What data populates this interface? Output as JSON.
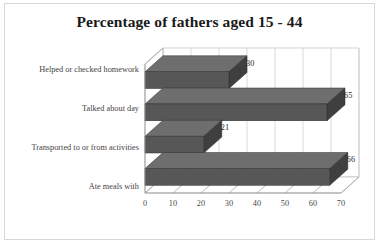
{
  "chart_data": {
    "type": "bar",
    "orientation": "horizontal",
    "title": "Percentage of fathers aged 15 - 44",
    "xlabel": "",
    "ylabel": "",
    "categories": [
      "Helped or checked homework",
      "Talked about day",
      "Transported to or from activities",
      "Ate meals with"
    ],
    "values": [
      30,
      65,
      21,
      66
    ],
    "data_labels": [
      "30",
      "65",
      "21",
      "66"
    ],
    "xlim": [
      0,
      70
    ],
    "xticks": [
      0,
      10,
      20,
      30,
      40,
      50,
      60,
      70
    ],
    "xtick_labels": [
      "0",
      "10",
      "20",
      "30",
      "40",
      "50",
      "60",
      "70"
    ],
    "grid": "vertical",
    "legend": "none",
    "style": "3d",
    "colors": {
      "bar_front": "#575757",
      "bar_top": "#6e6e6e",
      "bar_side": "#3f3f3f",
      "gridline": "#c9c9c9",
      "axis": "#9a9a9a",
      "title": "#1a1a1a",
      "text": "#3f3f3f",
      "background": "#ffffff",
      "frame": "#d8d8d8"
    }
  }
}
